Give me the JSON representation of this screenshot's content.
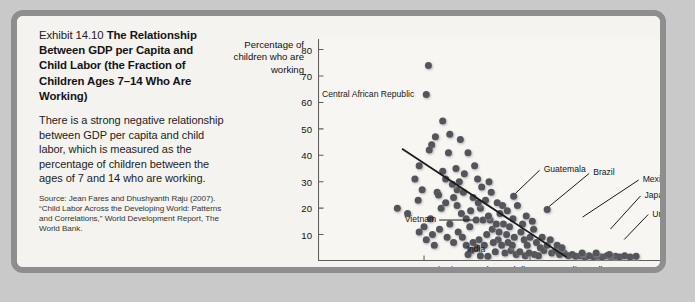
{
  "caption": {
    "exhibit_number": "Exhibit 14.10 ",
    "title": "The Relationship Between GDP per Capita and Child Labor (the Fraction of Children Ages 7–14 Who Are Working)",
    "body": "There is a strong negative relationship between GDP per capita and child labor, which is measured as the percentage of children between the ages of 7 and 14 who are working.",
    "source": "Source: Jean Fares and Dhushyanth Raju (2007). “Child Labor Across the Developing World: Patterns and Correlations,” World Development Report, The World Bank."
  },
  "chart_data": {
    "type": "scatter",
    "title": "",
    "xlabel": "GDP per capita in 2012 (U.S. dollars PPP-adjusted)",
    "ylabel": "Percentage of children who are working",
    "xscale": "log",
    "xlim": [
      100,
      200000
    ],
    "ylim": [
      0,
      84
    ],
    "grid": false,
    "legend": null,
    "xticks": [
      100,
      1000,
      10000,
      100000
    ],
    "xtick_labels": [
      "100",
      "1,000",
      "10,000",
      "100,000"
    ],
    "yticks": [
      10,
      20,
      30,
      40,
      50,
      60,
      70,
      80
    ],
    "ytick_labels": [
      "10",
      "20",
      "30",
      "40",
      "50",
      "60",
      "70",
      "80"
    ],
    "marker_color": "#53555a",
    "trendline": {
      "x": [
        620,
        22000
      ],
      "y": [
        42.5,
        1.5
      ],
      "color": "#1a1a1a"
    },
    "annotations": [
      {
        "label": "Central African Republic",
        "x": 1050,
        "y": 63,
        "anchor": "right",
        "leader": false
      },
      {
        "label": "Vietnam",
        "x": 3100,
        "y": 15.5,
        "anchor": "right",
        "leader": true
      },
      {
        "label": "India",
        "x": 4700,
        "y": 3.5,
        "anchor": "right",
        "leader": false
      },
      {
        "label": "Guatemala",
        "x": 7000,
        "y": 24.5,
        "anchor": "left",
        "leader": true
      },
      {
        "label": "Brazil",
        "x": 14500,
        "y": 19.5,
        "anchor": "left",
        "leader": true
      },
      {
        "label": "Mexico",
        "x": 30000,
        "y": 15.5,
        "anchor": "left",
        "leader": true
      },
      {
        "label": "Japan",
        "x": 55000,
        "y": 11.0,
        "anchor": "left",
        "leader": true
      },
      {
        "label": "United States",
        "x": 74000,
        "y": 7.0,
        "anchor": "left",
        "leader": true
      }
    ],
    "points": [
      {
        "x": 1100,
        "y": 74
      },
      {
        "x": 1050,
        "y": 63
      },
      {
        "x": 1500,
        "y": 53
      },
      {
        "x": 1280,
        "y": 47
      },
      {
        "x": 1750,
        "y": 48
      },
      {
        "x": 1700,
        "y": 41
      },
      {
        "x": 2600,
        "y": 41
      },
      {
        "x": 1180,
        "y": 44
      },
      {
        "x": 1120,
        "y": 42
      },
      {
        "x": 900,
        "y": 36
      },
      {
        "x": 820,
        "y": 31
      },
      {
        "x": 560,
        "y": 20
      },
      {
        "x": 700,
        "y": 18
      },
      {
        "x": 1330,
        "y": 26
      },
      {
        "x": 1370,
        "y": 25
      },
      {
        "x": 1500,
        "y": 34
      },
      {
        "x": 2000,
        "y": 35
      },
      {
        "x": 2150,
        "y": 30
      },
      {
        "x": 2400,
        "y": 33
      },
      {
        "x": 3000,
        "y": 36
      },
      {
        "x": 3200,
        "y": 31
      },
      {
        "x": 1450,
        "y": 20
      },
      {
        "x": 1600,
        "y": 22
      },
      {
        "x": 1900,
        "y": 24
      },
      {
        "x": 2050,
        "y": 21
      },
      {
        "x": 2250,
        "y": 18
      },
      {
        "x": 2500,
        "y": 16
      },
      {
        "x": 1750,
        "y": 14
      },
      {
        "x": 1400,
        "y": 12
      },
      {
        "x": 1200,
        "y": 10
      },
      {
        "x": 1000,
        "y": 13
      },
      {
        "x": 1150,
        "y": 16
      },
      {
        "x": 900,
        "y": 11
      },
      {
        "x": 1650,
        "y": 9
      },
      {
        "x": 2100,
        "y": 11
      },
      {
        "x": 2700,
        "y": 13
      },
      {
        "x": 3100,
        "y": 15.5
      },
      {
        "x": 3600,
        "y": 15.5
      },
      {
        "x": 4200,
        "y": 15.5
      },
      {
        "x": 3400,
        "y": 20
      },
      {
        "x": 3800,
        "y": 23
      },
      {
        "x": 4300,
        "y": 26
      },
      {
        "x": 4900,
        "y": 22
      },
      {
        "x": 5200,
        "y": 18
      },
      {
        "x": 5600,
        "y": 14
      },
      {
        "x": 4400,
        "y": 12
      },
      {
        "x": 3900,
        "y": 10
      },
      {
        "x": 3300,
        "y": 8
      },
      {
        "x": 2900,
        "y": 7
      },
      {
        "x": 2500,
        "y": 6
      },
      {
        "x": 5000,
        "y": 8
      },
      {
        "x": 5400,
        "y": 6
      },
      {
        "x": 6000,
        "y": 10
      },
      {
        "x": 6400,
        "y": 13
      },
      {
        "x": 6900,
        "y": 16
      },
      {
        "x": 7000,
        "y": 24.5
      },
      {
        "x": 7600,
        "y": 21
      },
      {
        "x": 8200,
        "y": 11
      },
      {
        "x": 8800,
        "y": 8
      },
      {
        "x": 9400,
        "y": 6
      },
      {
        "x": 10000,
        "y": 9
      },
      {
        "x": 10800,
        "y": 12
      },
      {
        "x": 11500,
        "y": 7
      },
      {
        "x": 12500,
        "y": 5
      },
      {
        "x": 13500,
        "y": 4
      },
      {
        "x": 14500,
        "y": 6
      },
      {
        "x": 14500,
        "y": 19.5
      },
      {
        "x": 16000,
        "y": 3
      },
      {
        "x": 17500,
        "y": 4
      },
      {
        "x": 19000,
        "y": 2.5
      },
      {
        "x": 21000,
        "y": 3
      },
      {
        "x": 23000,
        "y": 2
      },
      {
        "x": 25000,
        "y": 2.5
      },
      {
        "x": 27000,
        "y": 1.8
      },
      {
        "x": 30000,
        "y": 2
      },
      {
        "x": 33000,
        "y": 1.5
      },
      {
        "x": 36000,
        "y": 2
      },
      {
        "x": 40000,
        "y": 1.5
      },
      {
        "x": 44000,
        "y": 1.8
      },
      {
        "x": 48000,
        "y": 1.5
      },
      {
        "x": 53000,
        "y": 2
      },
      {
        "x": 58000,
        "y": 1.5
      },
      {
        "x": 64000,
        "y": 1.8
      },
      {
        "x": 70000,
        "y": 1.5
      },
      {
        "x": 78000,
        "y": 2
      },
      {
        "x": 88000,
        "y": 1.5
      },
      {
        "x": 100000,
        "y": 1.8
      },
      {
        "x": 2200,
        "y": 46
      },
      {
        "x": 2900,
        "y": 24
      },
      {
        "x": 3500,
        "y": 28
      },
      {
        "x": 4100,
        "y": 30
      },
      {
        "x": 4700,
        "y": 3.5
      },
      {
        "x": 5800,
        "y": 3
      },
      {
        "x": 6600,
        "y": 4
      },
      {
        "x": 7400,
        "y": 2.5
      },
      {
        "x": 8000,
        "y": 3.5
      },
      {
        "x": 9000,
        "y": 2
      },
      {
        "x": 9800,
        "y": 3
      },
      {
        "x": 11000,
        "y": 2.5
      },
      {
        "x": 12000,
        "y": 2
      },
      {
        "x": 1900,
        "y": 7
      },
      {
        "x": 2300,
        "y": 9
      },
      {
        "x": 2800,
        "y": 4
      },
      {
        "x": 3150,
        "y": 5
      },
      {
        "x": 3700,
        "y": 6
      },
      {
        "x": 4500,
        "y": 7
      },
      {
        "x": 5100,
        "y": 11
      },
      {
        "x": 6200,
        "y": 7
      },
      {
        "x": 7100,
        "y": 9
      },
      {
        "x": 8500,
        "y": 14
      },
      {
        "x": 9200,
        "y": 17
      },
      {
        "x": 10500,
        "y": 15
      },
      {
        "x": 2050,
        "y": 27
      },
      {
        "x": 2350,
        "y": 26
      },
      {
        "x": 1850,
        "y": 29
      },
      {
        "x": 1600,
        "y": 31
      },
      {
        "x": 2750,
        "y": 19
      },
      {
        "x": 3250,
        "y": 22
      },
      {
        "x": 4050,
        "y": 17
      },
      {
        "x": 4800,
        "y": 14
      },
      {
        "x": 5500,
        "y": 21
      },
      {
        "x": 6100,
        "y": 19
      },
      {
        "x": 6800,
        "y": 6
      },
      {
        "x": 13000,
        "y": 9
      },
      {
        "x": 15500,
        "y": 8
      },
      {
        "x": 18000,
        "y": 6
      },
      {
        "x": 20000,
        "y": 5
      },
      {
        "x": 2600,
        "y": 2.5
      },
      {
        "x": 3400,
        "y": 2
      },
      {
        "x": 4000,
        "y": 1.8
      },
      {
        "x": 31000,
        "y": 3
      },
      {
        "x": 42000,
        "y": 3
      },
      {
        "x": 56000,
        "y": 2.5
      },
      {
        "x": 1250,
        "y": 6
      },
      {
        "x": 1050,
        "y": 8
      },
      {
        "x": 880,
        "y": 23
      },
      {
        "x": 960,
        "y": 27
      }
    ]
  }
}
